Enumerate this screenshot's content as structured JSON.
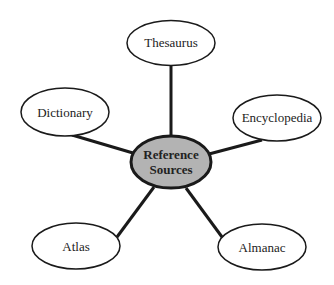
{
  "diagram": {
    "type": "concept-map",
    "center": {
      "label_line1": "Reference",
      "label_line2": "Sources",
      "fill": "#b3b3b3"
    },
    "nodes": [
      {
        "id": "thesaurus",
        "label": "Thesaurus"
      },
      {
        "id": "dictionary",
        "label": "Dictionary"
      },
      {
        "id": "encyclopedia",
        "label": "Encyclopedia"
      },
      {
        "id": "atlas",
        "label": "Atlas"
      },
      {
        "id": "almanac",
        "label": "Almanac"
      }
    ],
    "stroke": "#1a1a1a"
  }
}
